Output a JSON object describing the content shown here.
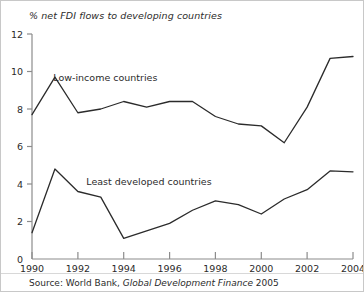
{
  "chart_data": {
    "type": "line",
    "title": "% net FDI flows to developing countries",
    "xlabel": "",
    "ylabel": "",
    "xlim": [
      1990,
      2004
    ],
    "ylim": [
      0,
      12
    ],
    "grid": false,
    "legend_position": "inline-annotation",
    "x": [
      1990,
      1991,
      1992,
      1993,
      1994,
      1995,
      1996,
      1997,
      1998,
      1999,
      2000,
      2001,
      2002,
      2003,
      2004
    ],
    "y_ticks": [
      0,
      2,
      4,
      6,
      8,
      10,
      12
    ],
    "x_ticks": [
      1990,
      1992,
      1994,
      1996,
      1998,
      2000,
      2002,
      2004
    ],
    "x_tick_labels": [
      "1990",
      "1992",
      "1994",
      "1996",
      "1998",
      "2000",
      "2002",
      "2004"
    ],
    "y_tick_labels": [
      "0",
      "2",
      "4",
      "6",
      "8",
      "10",
      "12"
    ],
    "series": [
      {
        "name": "Low-income countries",
        "values": [
          7.7,
          9.7,
          7.8,
          8.0,
          8.4,
          8.1,
          8.4,
          8.4,
          7.6,
          7.2,
          7.1,
          6.2,
          8.1,
          10.7,
          10.8
        ],
        "color": "#2b2b2b",
        "label_x": 1993.2,
        "label_y": 9.5
      },
      {
        "name": "Least developed countries",
        "values": [
          1.4,
          4.8,
          3.6,
          3.3,
          1.1,
          1.5,
          1.9,
          2.6,
          3.1,
          2.9,
          2.4,
          3.2,
          3.7,
          4.7,
          4.65
        ],
        "color": "#2b2b2b",
        "label_x": 1995.1,
        "label_y": 3.95
      }
    ],
    "annotations": [
      {
        "text": "Low-income countries",
        "x": 1993.2,
        "y": 9.5
      },
      {
        "text": "Least developed countries",
        "x": 1995.1,
        "y": 3.95
      }
    ],
    "source": {
      "prefix": "Source: World Bank,",
      "publication": "Global Development Finance",
      "year": "2005"
    }
  }
}
